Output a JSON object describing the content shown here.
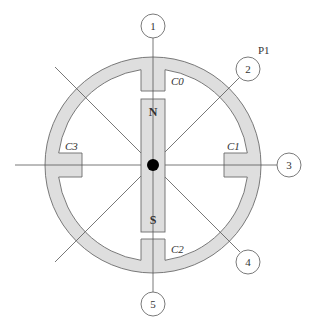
{
  "diagram": {
    "center": {
      "x": 153,
      "y": 165
    },
    "ring": {
      "outer_radius": 108,
      "inner_radius": 97,
      "fill": "#dedede",
      "stroke": "#6b6b6b"
    },
    "magnet": {
      "north_label": "N",
      "south_label": "S",
      "fill": "#dedede"
    },
    "pivot_color": "#000000",
    "line_color": "#555555",
    "callouts": [
      {
        "id": "1",
        "label": "1"
      },
      {
        "id": "2",
        "label": "2"
      },
      {
        "id": "3",
        "label": "3"
      },
      {
        "id": "4",
        "label": "4"
      },
      {
        "id": "5",
        "label": "5"
      }
    ],
    "coils": [
      {
        "id": "C0",
        "label": "C0"
      },
      {
        "id": "C1",
        "label": "C1"
      },
      {
        "id": "C2",
        "label": "C2"
      },
      {
        "id": "C3",
        "label": "C3"
      }
    ],
    "point_label": "P1"
  }
}
